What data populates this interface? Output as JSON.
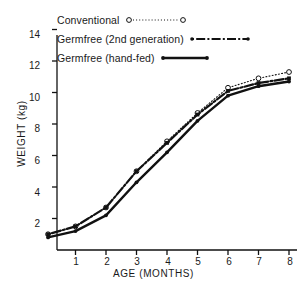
{
  "chart_data": {
    "type": "line",
    "title": "",
    "xlabel": "AGE (MONTHS)",
    "ylabel": "WEIGHT (kg)",
    "xlim": [
      0,
      8
    ],
    "ylim": [
      0,
      14
    ],
    "xticks": [
      1,
      2,
      3,
      4,
      5,
      6,
      7,
      8
    ],
    "yticks": [
      2,
      4,
      6,
      8,
      10,
      12,
      14
    ],
    "grid": false,
    "legend_position": "top-left",
    "x": [
      0.1,
      1,
      2,
      3,
      4,
      5,
      6,
      7,
      8
    ],
    "series": [
      {
        "name": "Conventional",
        "marker": "open-circle",
        "line_style": "dotted",
        "color": "#111111",
        "values": [
          1.0,
          1.5,
          2.7,
          5.0,
          6.9,
          8.7,
          10.3,
          10.9,
          11.3
        ]
      },
      {
        "name": "Germfree (2nd generation)",
        "marker": "filled-square",
        "line_style": "dash-dot",
        "color": "#111111",
        "values": [
          1.0,
          1.5,
          2.7,
          5.0,
          6.8,
          8.6,
          10.1,
          10.6,
          10.9
        ]
      },
      {
        "name": "Germfree (hand-fed)",
        "marker": "filled-circle",
        "line_style": "solid",
        "color": "#111111",
        "values": [
          0.8,
          1.2,
          2.2,
          4.3,
          6.2,
          8.2,
          9.8,
          10.4,
          10.7
        ]
      }
    ]
  },
  "legend": {
    "items": [
      {
        "label": "Conventional",
        "sample": "dotted-open-circle"
      },
      {
        "label": "Germfree (2nd generation)",
        "sample": "dash-dot-filled"
      },
      {
        "label": "Germfree (hand-fed)",
        "sample": "solid-filled"
      }
    ]
  },
  "axes": {
    "y_title": "WEIGHT (kg)",
    "x_title": "AGE (MONTHS)",
    "y_tick_labels": [
      "14",
      "12",
      "10",
      "8",
      "6",
      "4",
      "2"
    ],
    "x_tick_labels": [
      "1",
      "2",
      "3",
      "4",
      "5",
      "6",
      "7",
      "8"
    ]
  }
}
